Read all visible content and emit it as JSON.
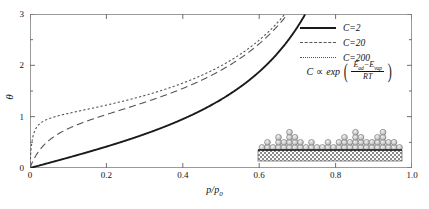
{
  "chart_data": {
    "type": "line",
    "title": "",
    "xlabel": "p/p0",
    "ylabel": "theta",
    "xlim": [
      0,
      1.0
    ],
    "ylim": [
      0,
      3
    ],
    "grid": false,
    "legend_position": "top-right",
    "x_ticks": [
      "0",
      "0.2",
      "0.4",
      "0.6",
      "0.8",
      "1.0"
    ],
    "x_tick_values": [
      0,
      0.2,
      0.4,
      0.6,
      0.8,
      1.0
    ],
    "y_ticks": [
      "0",
      "1",
      "2",
      "3"
    ],
    "y_tick_values": [
      0,
      1,
      2,
      3
    ],
    "y_minor_tick_values": [
      0.5,
      1.5,
      2.5
    ],
    "equation": "theta = C*x / ((1-x)*(1-x+C*x))",
    "series": [
      {
        "name": "C=2",
        "C": 2,
        "style": "solid",
        "color": "#1a1a1a",
        "x": [
          0,
          0.02,
          0.05,
          0.1,
          0.15,
          0.2,
          0.25,
          0.3,
          0.35,
          0.4,
          0.45,
          0.5,
          0.55,
          0.6,
          0.65,
          0.7,
          0.72,
          0.75,
          0.78
        ],
        "y": [
          0,
          0.04,
          0.1,
          0.21,
          0.33,
          0.45,
          0.58,
          0.73,
          0.89,
          1.07,
          1.27,
          1.5,
          1.77,
          2.08,
          2.47,
          2.95,
          3.0,
          3.0,
          3.0
        ]
      },
      {
        "name": "C=20",
        "C": 20,
        "style": "dashed",
        "color": "#555555",
        "x": [
          0,
          0.01,
          0.02,
          0.04,
          0.06,
          0.08,
          0.1,
          0.15,
          0.2,
          0.25,
          0.3,
          0.35,
          0.4,
          0.45,
          0.5,
          0.55,
          0.6,
          0.65,
          0.68,
          0.7
        ],
        "y": [
          0,
          0.17,
          0.29,
          0.46,
          0.57,
          0.65,
          0.71,
          0.84,
          0.95,
          1.06,
          1.18,
          1.31,
          1.46,
          1.64,
          1.86,
          2.13,
          2.5,
          3.0,
          3.0,
          3.0
        ]
      },
      {
        "name": "C=200",
        "C": 200,
        "style": "dotted",
        "color": "#555555",
        "x": [
          0,
          0.005,
          0.01,
          0.02,
          0.03,
          0.05,
          0.07,
          0.1,
          0.15,
          0.2,
          0.25,
          0.3,
          0.35,
          0.4,
          0.45,
          0.5,
          0.55,
          0.6,
          0.64,
          0.67
        ],
        "y": [
          0,
          0.5,
          0.67,
          0.81,
          0.87,
          0.94,
          0.99,
          1.05,
          1.14,
          1.23,
          1.33,
          1.44,
          1.56,
          1.71,
          1.89,
          2.12,
          2.43,
          2.87,
          3.0,
          3.0
        ]
      }
    ]
  },
  "axes": {
    "y_label": "θ",
    "x_label_numerator": "p",
    "x_label_denominator": "p",
    "x_label_subscript": "0"
  },
  "legend": {
    "items": [
      {
        "label": "C=2",
        "style": "solid"
      },
      {
        "label": "C=20",
        "style": "dashed"
      },
      {
        "label": "C=200",
        "style": "dotted"
      }
    ]
  },
  "formula": {
    "left": "C",
    "proportional": "∝",
    "function": "exp",
    "numerator_first": "E",
    "numerator_first_sub": "ad",
    "minus": "−",
    "numerator_second": "E",
    "numerator_second_sub": "vap",
    "denominator": "RT"
  },
  "inset": {
    "name": "multilayer-adsorption-diagram",
    "substrate_color": "#8c8c8c",
    "sphere_fill": "#cfcfcf",
    "sphere_stroke": "#6f6f6f",
    "column_heights": [
      1,
      2,
      1,
      3,
      2,
      4,
      3,
      2,
      1,
      2,
      1,
      1,
      2,
      1,
      2,
      3,
      2,
      4,
      3,
      2,
      2,
      3,
      4,
      2,
      2,
      1
    ]
  }
}
